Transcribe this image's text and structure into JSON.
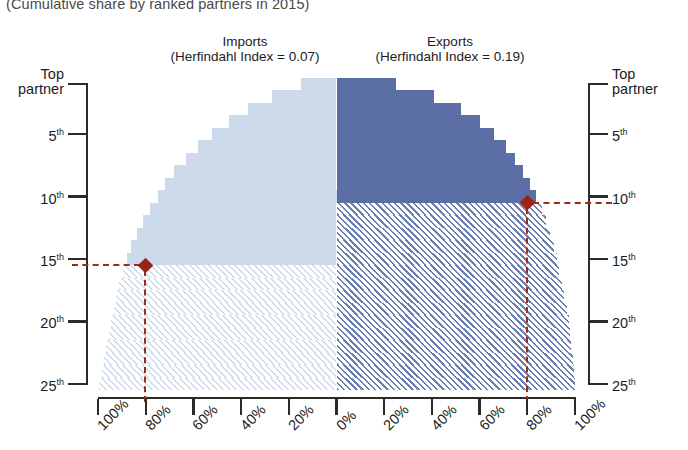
{
  "subtitle": "(Cumulative share by ranked partners in 2015)",
  "panels": {
    "imports": {
      "title": "Imports",
      "metric": "(Herfindahl Index = 0.07)"
    },
    "exports": {
      "title": "Exports",
      "metric": "(Herfindahl Index = 0.19)"
    }
  },
  "axes": {
    "y_left_caption_line1": "Top",
    "y_left_caption_line2": "partner",
    "y_right_caption_line1": "Top",
    "y_right_caption_line2": "partner",
    "y_ticks": [
      "5",
      "10",
      "15",
      "20",
      "25"
    ],
    "y_suffix": "th",
    "x_ticks": [
      "100%",
      "80%",
      "60%",
      "40%",
      "20%",
      "0%",
      "20%",
      "40%",
      "60%",
      "80%",
      "100%"
    ]
  },
  "colors": {
    "exports_solid": "#5b6fa6",
    "exports_hatch": "#6b7fb2",
    "imports_solid": "#ccdaec",
    "imports_hatch": "#cfdcee",
    "marker": "#9b2318",
    "guide_line": "#9b2d16",
    "axis": "#2b2b2b"
  },
  "markers": {
    "imports": {
      "partner_rank": 15,
      "share": "80%",
      "label": "15th partner reaches ~80% of imports"
    },
    "exports": {
      "partner_rank": 10,
      "share": "80%",
      "label": "10th partner reaches ~80% of exports"
    }
  },
  "chart_data": {
    "type": "bar",
    "orientation": "horizontal-mirrored-pyramid",
    "subtitle": "(Cumulative share by ranked partners in 2015)",
    "xlabel": "",
    "ylabel": "Partner rank",
    "xlim": [
      -100,
      100
    ],
    "x_tick_values": [
      -100,
      -80,
      -60,
      -40,
      -20,
      0,
      20,
      40,
      60,
      80,
      100
    ],
    "x_tick_labels": [
      "100%",
      "80%",
      "60%",
      "40%",
      "20%",
      "0%",
      "20%",
      "40%",
      "60%",
      "80%",
      "100%"
    ],
    "ylim": [
      25,
      1
    ],
    "y_tick_values": [
      1,
      5,
      10,
      15,
      20,
      25
    ],
    "y_tick_labels": [
      "Top partner",
      "5th",
      "10th",
      "15th",
      "20th",
      "25th"
    ],
    "grid": false,
    "legend_position": "top",
    "categories": [
      1,
      2,
      3,
      4,
      5,
      6,
      7,
      8,
      9,
      10,
      11,
      12,
      13,
      14,
      15,
      16,
      17,
      18,
      19,
      20,
      21,
      22,
      23,
      24,
      25
    ],
    "series": [
      {
        "name": "Imports (Herfindahl Index = 0.07)",
        "direction": "left",
        "solid_through_rank": 15,
        "values": [
          15,
          27,
          37,
          45,
          52,
          58,
          63,
          68,
          72,
          75,
          78,
          81,
          83.5,
          86,
          88,
          89.5,
          91,
          92.5,
          93.5,
          94.5,
          95.5,
          96.5,
          97.5,
          98.5,
          99.5
        ]
      },
      {
        "name": "Exports (Herfindahl Index = 0.19)",
        "direction": "right",
        "solid_through_rank": 10,
        "values": [
          25,
          41,
          52,
          60,
          66,
          71,
          75,
          78,
          81,
          83.5,
          86,
          88,
          89.5,
          91,
          92.5,
          93.5,
          94.5,
          95.5,
          96.5,
          97.5,
          98,
          98.5,
          99,
          99.5,
          100
        ]
      }
    ],
    "annotations": [
      {
        "text": "Imports",
        "detail": "(Herfindahl Index = 0.07)",
        "x": -50,
        "y": 0
      },
      {
        "text": "Exports",
        "detail": "(Herfindahl Index = 0.19)",
        "x": 50,
        "y": 0
      },
      {
        "text": "marker",
        "side": "imports",
        "x": -80,
        "y": 15
      },
      {
        "text": "marker",
        "side": "exports",
        "x": 80,
        "y": 10
      }
    ]
  }
}
